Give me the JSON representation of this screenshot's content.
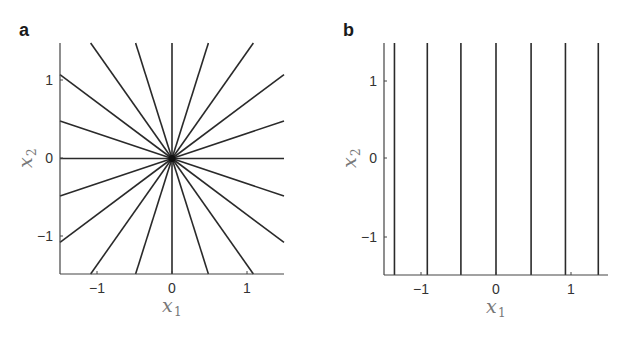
{
  "figure": {
    "panels": [
      {
        "id": "a",
        "label": "a",
        "xlabel": "x",
        "xlabel_sub": "1",
        "ylabel": "x",
        "ylabel_sub": "2",
        "xticks": [
          "−1",
          "0",
          "1"
        ],
        "yticks": [
          "1",
          "0",
          "−1"
        ]
      },
      {
        "id": "b",
        "label": "b",
        "xlabel": "x",
        "xlabel_sub": "1",
        "ylabel": "x",
        "ylabel_sub": "2",
        "xticks": [
          "−1",
          "0",
          "1"
        ],
        "yticks": [
          "1",
          "0",
          "−1"
        ]
      }
    ]
  },
  "chart_data": [
    {
      "type": "line",
      "title": "a",
      "description": "Radial lines through the origin (star pattern), 20 rays at 18° increments",
      "xlabel": "x1",
      "ylabel": "x2",
      "xlim": [
        -1.5,
        1.5
      ],
      "ylim": [
        -1.5,
        1.5
      ],
      "xticks": [
        -1,
        0,
        1
      ],
      "yticks": [
        -1,
        0,
        1
      ],
      "grid": false,
      "ray_angles_deg": [
        0,
        18,
        36,
        54,
        72,
        90,
        108,
        126,
        144,
        162,
        180,
        198,
        216,
        234,
        252,
        270,
        288,
        306,
        324,
        342
      ],
      "line_color": "#2a2a2a"
    },
    {
      "type": "line",
      "title": "b",
      "description": "Vertical lines at constant x1",
      "xlabel": "x1",
      "ylabel": "x2",
      "xlim": [
        -1.5,
        1.5
      ],
      "ylim": [
        -1.5,
        1.5
      ],
      "xticks": [
        -1,
        0,
        1
      ],
      "yticks": [
        -1,
        0,
        1
      ],
      "grid": false,
      "vertical_line_x": [
        -1.36,
        -0.92,
        -0.47,
        0,
        0.47,
        0.93,
        1.37
      ],
      "line_color": "#2a2a2a"
    }
  ]
}
